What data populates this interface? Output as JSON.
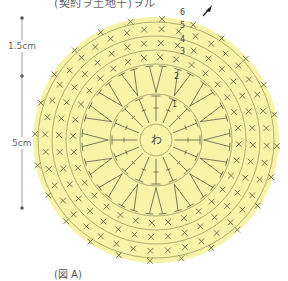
{
  "title": "(契約ヲ土地干)ヲル",
  "caption": "(図 A)",
  "dimensions": [
    {
      "label": "1.5cm",
      "span": "outer rows 4-6"
    },
    {
      "label": "5cm",
      "span": "inner rows 1-3 diameter portion"
    }
  ],
  "diagram": {
    "center_label": "わ",
    "fill_color": "#f7f1a0",
    "line_color": "#8a8a55",
    "symbol_color": "#555544",
    "rows": [
      {
        "number": "1",
        "stitch": "tall (treble) stitches"
      },
      {
        "number": "2",
        "stitch": "V increases of tall stitches"
      },
      {
        "number": "3",
        "stitch": "single crochet ×"
      },
      {
        "number": "4",
        "stitch": "single crochet ×"
      },
      {
        "number": "5",
        "stitch": "single crochet ×"
      },
      {
        "number": "6",
        "stitch": "single crochet × with V increases"
      }
    ],
    "start_marker": "arrow"
  }
}
